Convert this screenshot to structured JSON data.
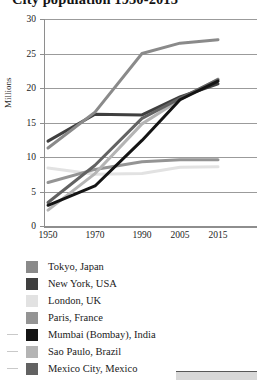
{
  "title": "City population 1950-2015",
  "axis": {
    "ylabel": "Millions",
    "yticks": [
      "0",
      "5",
      "10",
      "15",
      "20",
      "25",
      "30"
    ],
    "xticks": [
      "1950",
      "1970",
      "1990",
      "2005",
      "2015"
    ]
  },
  "legend": {
    "items": [
      {
        "label": "Tokyo, Japan",
        "color": "#8a8a8a",
        "dash": false
      },
      {
        "label": "New York, USA",
        "color": "#3f3f3f",
        "dash": false
      },
      {
        "label": "London, UK",
        "color": "#e2e2e2",
        "dash": false
      },
      {
        "label": "Paris, France",
        "color": "#949494",
        "dash": false
      },
      {
        "label": "Mumbai (Bombay), India",
        "color": "#141414",
        "dash": true
      },
      {
        "label": "Sao Paulo, Brazil",
        "color": "#b4b4b4",
        "dash": true
      },
      {
        "label": "Mexico City, Mexico",
        "color": "#626262",
        "dash": true
      }
    ]
  },
  "chart_data": {
    "type": "line",
    "title": "City population 1950-2015",
    "xlabel": "",
    "ylabel": "Millions",
    "x": [
      "1950",
      "1970",
      "1990",
      "2005",
      "2015"
    ],
    "ylim": [
      0,
      30
    ],
    "ytick_step": 5,
    "grid": true,
    "legend_position": "below",
    "series": [
      {
        "name": "Tokyo, Japan",
        "color": "#8a8a8a",
        "values": [
          11.3,
          16.5,
          25.0,
          26.5,
          27.0
        ]
      },
      {
        "name": "New York, USA",
        "color": "#3f3f3f",
        "values": [
          12.3,
          16.2,
          16.1,
          18.7,
          20.6
        ]
      },
      {
        "name": "London, UK",
        "color": "#e2e2e2",
        "values": [
          8.4,
          7.5,
          7.6,
          8.5,
          8.6
        ]
      },
      {
        "name": "Paris, France",
        "color": "#949494",
        "values": [
          6.3,
          8.2,
          9.3,
          9.6,
          9.6
        ]
      },
      {
        "name": "Mumbai (Bombay), India",
        "color": "#141414",
        "values": [
          3.0,
          5.8,
          12.4,
          18.3,
          21.0
        ]
      },
      {
        "name": "Sao Paulo, Brazil",
        "color": "#b4b4b4",
        "values": [
          2.3,
          7.6,
          14.8,
          18.3,
          21.3
        ]
      },
      {
        "name": "Mexico City, Mexico",
        "color": "#626262",
        "values": [
          3.4,
          8.8,
          15.6,
          18.5,
          21.2
        ]
      }
    ]
  }
}
